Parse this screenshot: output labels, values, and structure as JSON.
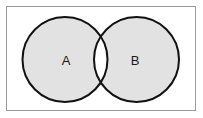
{
  "figure": {
    "kind": "venn-diagram",
    "title": "",
    "width": 203,
    "height": 118,
    "background_color": "#ffffff"
  },
  "frame": {
    "name": "universal-set-rectangle",
    "x": 6,
    "y": 6,
    "width": 190,
    "height": 105,
    "stroke_color": "#9a9a9a",
    "stroke_width": 1,
    "fill_color": "#ffffff",
    "label": ""
  },
  "sets": [
    {
      "id": "A",
      "label": "A",
      "cx": 65,
      "cy": 59.5,
      "r": 42.5,
      "fill_color": "#e2e2e2",
      "stroke_color": "#111111",
      "stroke_width": 2,
      "label_x": 66,
      "label_y": 60
    },
    {
      "id": "B",
      "label": "B",
      "cx": 136.5,
      "cy": 59.5,
      "r": 42.5,
      "fill_color": "#e2e2e2",
      "stroke_color": "#111111",
      "stroke_width": 2,
      "label_x": 135,
      "label_y": 60
    }
  ],
  "intersection": {
    "name": "intersection-lens",
    "label": "",
    "fill_color": "#ffffff",
    "shaded": false
  }
}
